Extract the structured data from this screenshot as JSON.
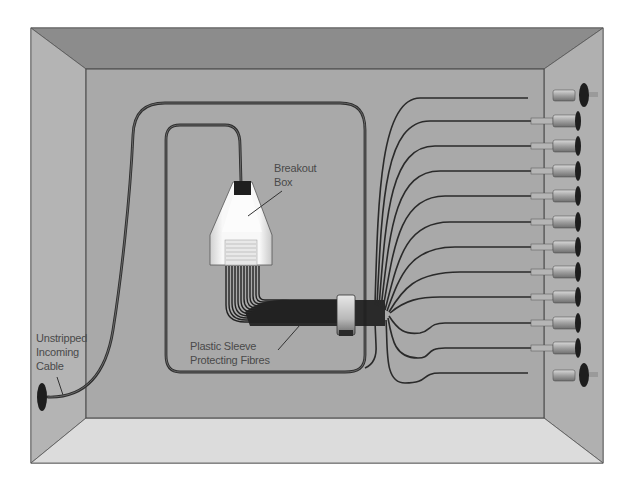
{
  "diagram": {
    "labels": {
      "breakout_box_line1": "Breakout",
      "breakout_box_line2": "Box",
      "sleeve_line1": "Plastic Sleeve",
      "sleeve_line2": "Protecting Fibres",
      "cable_line1": "Unstripped",
      "cable_line2": "Incoming",
      "cable_line3": "Cable"
    },
    "components": [
      "enclosure",
      "incoming-cable",
      "cable-loop",
      "breakout-box",
      "fibre-bundle",
      "sleeve-clamp",
      "fibres",
      "connectors",
      "mounting-bolts",
      "cable-grommet"
    ],
    "connector_count": 10,
    "fibre_count": 12,
    "colors": {
      "back_panel": "#a9a9a9",
      "top_wall": "#8c8c8c",
      "side_wall": "#b4b4b4",
      "floor": "#dcdcdc",
      "cable": "#2e2e2e",
      "breakout_box": "#f4f4f4",
      "label_text": "#4a4a4a"
    }
  }
}
